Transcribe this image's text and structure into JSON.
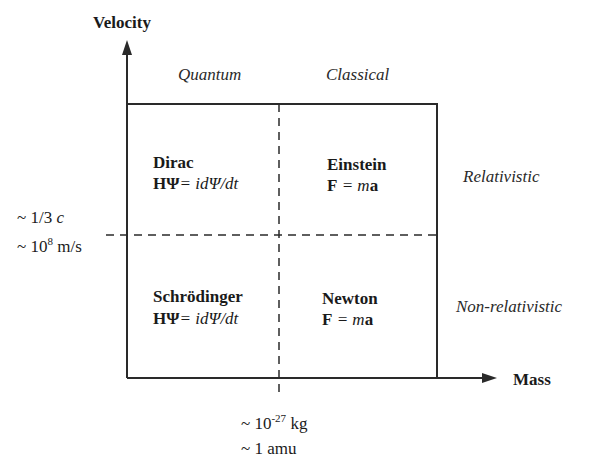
{
  "axes": {
    "y_label": "Velocity",
    "x_label": "Mass"
  },
  "regions": {
    "top_left": "Quantum",
    "top_right": "Classical",
    "right_top": "Relativistic",
    "right_bottom": "Non-relativistic"
  },
  "quadrants": {
    "top_left": {
      "name": "Dirac",
      "eq_lhs": "HΨ",
      "eq_rhs": "= idΨ/dt"
    },
    "top_right": {
      "name": "Einstein",
      "eq_F": "F",
      "eq_rhs": " = m",
      "eq_a": "a"
    },
    "bottom_left": {
      "name": "Schrödinger",
      "eq_lhs": "HΨ",
      "eq_rhs": "= idΨ/dt"
    },
    "bottom_right": {
      "name": "Newton",
      "eq_F": "F",
      "eq_rhs": " = m",
      "eq_a": "a"
    }
  },
  "ticks": {
    "velocity_line1": "~ 1/3 ",
    "velocity_line1_c": "c",
    "velocity_line2_pre": "~ 10",
    "velocity_line2_exp": "8",
    "velocity_line2_unit": " m/s",
    "mass_line1_pre": "~ 10",
    "mass_line1_exp": "-27",
    "mass_line1_unit": " kg",
    "mass_line2": "~ 1 amu"
  },
  "colors": {
    "line": "#2a2a2a",
    "text": "#1a1a1a",
    "background": "#ffffff"
  }
}
